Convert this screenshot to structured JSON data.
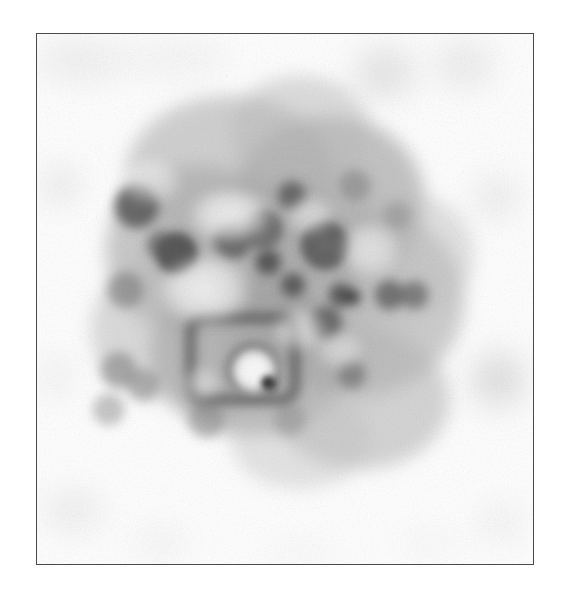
{
  "page": {
    "width": 563,
    "height": 592,
    "background_color": "#ffffff",
    "caption": ""
  },
  "figure": {
    "name": "electron-micrograph",
    "kind": "grayscale-transmission-electron-micrograph",
    "frame": {
      "x": 36,
      "y": 33,
      "width": 498,
      "height": 532,
      "border_color": "#4a4a4c",
      "border_width_px": 1.4,
      "fill_color": "#ffffff"
    },
    "tone": {
      "paper_white": "#ffffff",
      "light_haze": "#f0f0f0",
      "mid_gray": "#bdbdbd",
      "dark_gray": "#7a7a7a",
      "darkest": "#2e2e2e"
    },
    "blur_px": 9,
    "grain_opacity": 0.16
  },
  "image_content": {
    "type": "micrograph",
    "description": "Blurred grayscale particle cluster with annular vesicle-like rings and a boxed rectangular dark outline in the lower-left quadrant, surrounded by faint background specks.",
    "main_mass": {
      "center_x": 278,
      "center_y": 290,
      "radius_x": 175,
      "radius_y": 165,
      "peak_gray": "#9e9e9e"
    },
    "haze_blobs": [
      {
        "cx": 230,
        "cy": 175,
        "rx": 105,
        "ry": 80,
        "gray": "#b4b4b4",
        "alpha": 0.62
      },
      {
        "cx": 330,
        "cy": 200,
        "rx": 95,
        "ry": 85,
        "gray": "#a8a8a8",
        "alpha": 0.68
      },
      {
        "cx": 195,
        "cy": 250,
        "rx": 90,
        "ry": 85,
        "gray": "#aeaeae",
        "alpha": 0.66
      },
      {
        "cx": 360,
        "cy": 300,
        "rx": 105,
        "ry": 95,
        "gray": "#b0b0b0",
        "alpha": 0.62
      },
      {
        "cx": 250,
        "cy": 355,
        "rx": 100,
        "ry": 80,
        "gray": "#a2a2a2",
        "alpha": 0.7
      },
      {
        "cx": 360,
        "cy": 400,
        "rx": 90,
        "ry": 70,
        "gray": "#b6b6b6",
        "alpha": 0.58
      },
      {
        "cx": 160,
        "cy": 330,
        "rx": 70,
        "ry": 70,
        "gray": "#bcbcbc",
        "alpha": 0.52
      },
      {
        "cx": 300,
        "cy": 130,
        "rx": 70,
        "ry": 55,
        "gray": "#bcbcbc",
        "alpha": 0.5
      },
      {
        "cx": 415,
        "cy": 255,
        "rx": 60,
        "ry": 60,
        "gray": "#c2c2c2",
        "alpha": 0.46
      },
      {
        "cx": 300,
        "cy": 440,
        "rx": 70,
        "ry": 50,
        "gray": "#c4c4c4",
        "alpha": 0.44
      }
    ],
    "dark_cores": [
      {
        "cx": 136,
        "cy": 206,
        "r": 22,
        "gray": "#5a5a5a",
        "alpha": 0.86
      },
      {
        "cx": 176,
        "cy": 253,
        "r": 20,
        "gray": "#4f4f4f",
        "alpha": 0.9
      },
      {
        "cx": 160,
        "cy": 245,
        "r": 14,
        "gray": "#606060",
        "alpha": 0.7
      },
      {
        "cx": 233,
        "cy": 240,
        "r": 19,
        "gray": "#5c5c5c",
        "alpha": 0.84
      },
      {
        "cx": 263,
        "cy": 228,
        "r": 16,
        "gray": "#5e5e5e",
        "alpha": 0.76
      },
      {
        "cx": 268,
        "cy": 262,
        "r": 13,
        "gray": "#4a4a4a",
        "alpha": 0.86
      },
      {
        "cx": 292,
        "cy": 195,
        "r": 14,
        "gray": "#555555",
        "alpha": 0.8
      },
      {
        "cx": 325,
        "cy": 245,
        "r": 22,
        "gray": "#5b5b5b",
        "alpha": 0.82
      },
      {
        "cx": 293,
        "cy": 285,
        "r": 12,
        "gray": "#4e4e4e",
        "alpha": 0.84
      },
      {
        "cx": 341,
        "cy": 295,
        "r": 12,
        "gray": "#4c4c4c",
        "alpha": 0.86
      },
      {
        "cx": 353,
        "cy": 297,
        "r": 8,
        "gray": "#3a3a3a",
        "alpha": 0.88
      },
      {
        "cx": 326,
        "cy": 323,
        "r": 16,
        "gray": "#595959",
        "alpha": 0.8
      },
      {
        "cx": 390,
        "cy": 295,
        "r": 15,
        "gray": "#5d5d5d",
        "alpha": 0.78
      },
      {
        "cx": 415,
        "cy": 295,
        "r": 14,
        "gray": "#626262",
        "alpha": 0.72
      },
      {
        "cx": 352,
        "cy": 375,
        "r": 14,
        "gray": "#6a6a6a",
        "alpha": 0.64
      },
      {
        "cx": 268,
        "cy": 383,
        "r": 7,
        "gray": "#1f1f1f",
        "alpha": 0.95
      },
      {
        "cx": 125,
        "cy": 290,
        "r": 18,
        "gray": "#787878",
        "alpha": 0.58
      },
      {
        "cx": 118,
        "cy": 370,
        "r": 18,
        "gray": "#7c7c7c",
        "alpha": 0.56
      },
      {
        "cx": 143,
        "cy": 385,
        "r": 16,
        "gray": "#828282",
        "alpha": 0.52
      },
      {
        "cx": 108,
        "cy": 410,
        "r": 16,
        "gray": "#8a8a8a",
        "alpha": 0.48
      },
      {
        "cx": 206,
        "cy": 420,
        "r": 18,
        "gray": "#828282",
        "alpha": 0.52
      },
      {
        "cx": 290,
        "cy": 420,
        "r": 16,
        "gray": "#8c8c8c",
        "alpha": 0.46
      },
      {
        "cx": 355,
        "cy": 185,
        "r": 16,
        "gray": "#7e7e7e",
        "alpha": 0.54
      },
      {
        "cx": 398,
        "cy": 215,
        "r": 14,
        "gray": "#8a8a8a",
        "alpha": 0.46
      }
    ],
    "rings": [
      {
        "cx": 325,
        "cy": 245,
        "r": 17,
        "stroke": "#5e5e5e",
        "width": 11,
        "alpha": 0.82,
        "label": "vesicle-ring-right"
      },
      {
        "cx": 263,
        "cy": 230,
        "r": 14,
        "stroke": "#636363",
        "width": 9,
        "alpha": 0.76,
        "label": "vesicle-ring-mid"
      },
      {
        "cx": 176,
        "cy": 253,
        "r": 13,
        "stroke": "#555555",
        "width": 9,
        "alpha": 0.82,
        "label": "vesicle-ring-left"
      },
      {
        "cx": 253,
        "cy": 370,
        "r": 22,
        "stroke": "#616161",
        "width": 10,
        "alpha": 0.78,
        "label": "vesicle-ring-lower"
      }
    ],
    "boxed_feature": {
      "label": "rectangular-outline-feature",
      "x": 190,
      "y": 318,
      "width": 105,
      "height": 82,
      "corner_radius": 14,
      "stroke": "#575757",
      "stroke_width": 11,
      "alpha": 0.8,
      "inner_bright_x": 254,
      "inner_bright_y": 371,
      "inner_bright_r": 20,
      "inner_bright_color": "#f3f3f3"
    },
    "bright_patches": [
      {
        "cx": 230,
        "cy": 215,
        "rx": 45,
        "ry": 30,
        "alpha": 0.8
      },
      {
        "cx": 205,
        "cy": 290,
        "rx": 50,
        "ry": 38,
        "alpha": 0.82
      },
      {
        "cx": 310,
        "cy": 215,
        "rx": 26,
        "ry": 22,
        "alpha": 0.55
      },
      {
        "cx": 300,
        "cy": 330,
        "rx": 30,
        "ry": 24,
        "alpha": 0.6
      },
      {
        "cx": 370,
        "cy": 250,
        "rx": 34,
        "ry": 30,
        "alpha": 0.62
      },
      {
        "cx": 150,
        "cy": 180,
        "rx": 34,
        "ry": 26,
        "alpha": 0.55
      },
      {
        "cx": 254,
        "cy": 371,
        "rx": 22,
        "ry": 20,
        "alpha": 0.78
      },
      {
        "cx": 340,
        "cy": 350,
        "rx": 26,
        "ry": 22,
        "alpha": 0.5
      },
      {
        "cx": 200,
        "cy": 385,
        "rx": 22,
        "ry": 20,
        "alpha": 0.45
      }
    ],
    "background_specks": [
      {
        "cx": 80,
        "cy": 60,
        "rx": 45,
        "ry": 20,
        "gray": "#e4e4e4",
        "alpha": 0.55
      },
      {
        "cx": 175,
        "cy": 58,
        "rx": 55,
        "ry": 18,
        "gray": "#e8e8e8",
        "alpha": 0.45
      },
      {
        "cx": 385,
        "cy": 72,
        "rx": 30,
        "ry": 26,
        "gray": "#d6d6d6",
        "alpha": 0.6
      },
      {
        "cx": 465,
        "cy": 64,
        "rx": 30,
        "ry": 24,
        "gray": "#dcdcdc",
        "alpha": 0.52
      },
      {
        "cx": 60,
        "cy": 185,
        "rx": 16,
        "ry": 18,
        "gray": "#d4d4d4",
        "alpha": 0.58
      },
      {
        "cx": 497,
        "cy": 197,
        "rx": 22,
        "ry": 22,
        "gray": "#dcdcdc",
        "alpha": 0.52
      },
      {
        "cx": 499,
        "cy": 380,
        "rx": 26,
        "ry": 26,
        "gray": "#cacaca",
        "alpha": 0.62
      },
      {
        "cx": 55,
        "cy": 378,
        "rx": 14,
        "ry": 20,
        "gray": "#dedede",
        "alpha": 0.48
      },
      {
        "cx": 72,
        "cy": 512,
        "rx": 30,
        "ry": 20,
        "gray": "#e0e0e0",
        "alpha": 0.5
      },
      {
        "cx": 160,
        "cy": 543,
        "rx": 28,
        "ry": 14,
        "gray": "#e6e6e6",
        "alpha": 0.44
      },
      {
        "cx": 502,
        "cy": 524,
        "rx": 22,
        "ry": 18,
        "gray": "#e2e2e2",
        "alpha": 0.46
      },
      {
        "cx": 300,
        "cy": 555,
        "rx": 40,
        "ry": 12,
        "gray": "#ededed",
        "alpha": 0.4
      },
      {
        "cx": 430,
        "cy": 545,
        "rx": 34,
        "ry": 12,
        "gray": "#ededed",
        "alpha": 0.38
      }
    ]
  }
}
